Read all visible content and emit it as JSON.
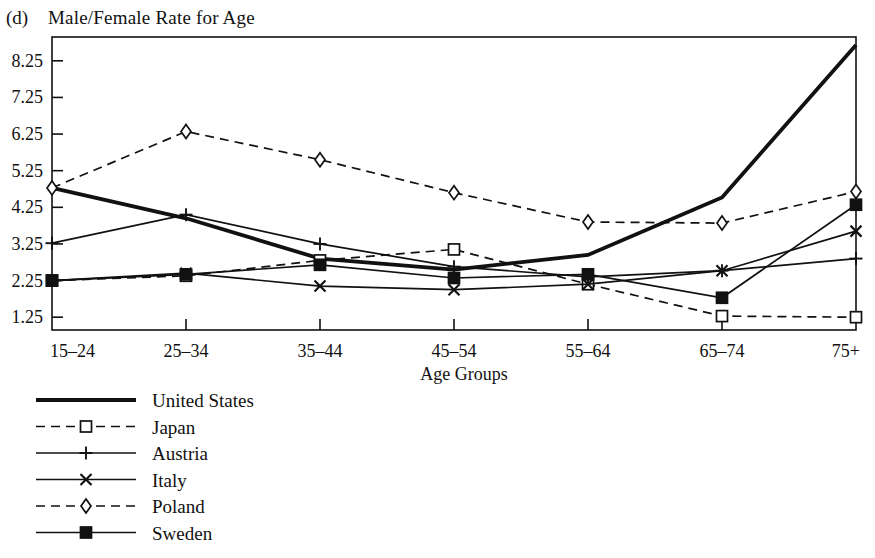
{
  "figure": {
    "panel_label": "(d)",
    "title": "Male/Female Rate for Age"
  },
  "chart_data": {
    "type": "line",
    "title": "Male/Female Rate for Age",
    "xlabel": "Age Groups",
    "ylabel": "",
    "categories": [
      "15–24",
      "25–34",
      "35–44",
      "45–54",
      "55–64",
      "65–74",
      "75+"
    ],
    "yticks": [
      "1.25",
      "2.25",
      "3.25",
      "4.25",
      "5.25",
      "6.25",
      "7.25",
      "8.25"
    ],
    "ylim": [
      0.9,
      8.9
    ],
    "grid": false,
    "legend_position": "below-left",
    "series": [
      {
        "name": "United States",
        "values": [
          4.78,
          3.95,
          2.85,
          2.55,
          2.95,
          4.52,
          8.68
        ],
        "style": "solid-thick",
        "marker": "none",
        "color": "#111111"
      },
      {
        "name": "Japan",
        "values": [
          2.25,
          2.38,
          2.8,
          3.1,
          2.15,
          1.28,
          1.25
        ],
        "style": "dashed",
        "marker": "open-square",
        "color": "#111111"
      },
      {
        "name": "Austria",
        "values": [
          3.27,
          4.05,
          3.25,
          2.63,
          2.35,
          2.52,
          2.85
        ],
        "style": "solid",
        "marker": "plus",
        "color": "#111111"
      },
      {
        "name": "Italy",
        "values": [
          2.25,
          2.45,
          2.1,
          2.0,
          2.15,
          2.52,
          3.6
        ],
        "style": "solid",
        "marker": "cross",
        "color": "#111111"
      },
      {
        "name": "Poland",
        "values": [
          4.78,
          6.32,
          5.55,
          4.65,
          3.85,
          3.82,
          4.68
        ],
        "style": "dashed",
        "marker": "open-diamond",
        "color": "#111111"
      },
      {
        "name": "Sweden",
        "values": [
          2.25,
          2.42,
          2.68,
          2.32,
          2.42,
          1.78,
          4.32
        ],
        "style": "solid",
        "marker": "filled-square",
        "color": "#111111"
      }
    ]
  },
  "legend": {
    "items": [
      {
        "label": "United States"
      },
      {
        "label": "Japan"
      },
      {
        "label": "Austria"
      },
      {
        "label": "Italy"
      },
      {
        "label": "Poland"
      },
      {
        "label": "Sweden"
      }
    ]
  }
}
